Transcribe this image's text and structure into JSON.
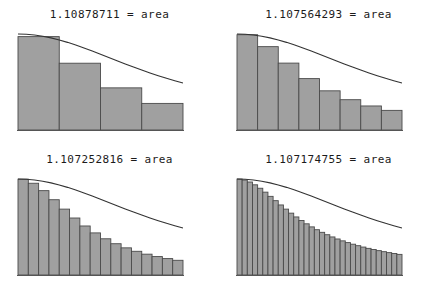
{
  "figure": {
    "title_suffix": "= area",
    "function_expression": "decreasing curve y = f(x)",
    "colors": {
      "bar_fill": "#a0a0a0",
      "bar_stroke": "#4a4a4a",
      "curve": "#333333",
      "axis": "#555555",
      "background": "#ffffff",
      "text": "#1b1b1b"
    }
  },
  "panels": [
    {
      "id": "panel-4",
      "position": "top-left",
      "title": "1.10878711 = area",
      "area_value": "1.10878711",
      "rectangle_count": 4
    },
    {
      "id": "panel-8",
      "position": "top-right",
      "title": "1.107564293 = area",
      "area_value": "1.107564293",
      "rectangle_count": 8
    },
    {
      "id": "panel-16",
      "position": "bottom-left",
      "title": "1.107252816 = area",
      "area_value": "1.107252816",
      "rectangle_count": 16
    },
    {
      "id": "panel-32",
      "position": "bottom-right",
      "title": "1.107174755 = area",
      "area_value": "1.107174755",
      "rectangle_count": 32
    }
  ],
  "chart_data": [
    {
      "type": "bar",
      "title": "1.10878711 = area",
      "subtitle": "",
      "xlabel": "",
      "ylabel": "",
      "legend": [],
      "grid": false,
      "n_rectangles": 4,
      "rule": "midpoint",
      "xlim": [
        0,
        1
      ],
      "ylim": [
        0,
        1
      ],
      "curve_label": "f(x)",
      "categories": [
        "0.125",
        "0.375",
        "0.625",
        "0.875"
      ],
      "bar_left_edges": [
        0.0,
        0.25,
        0.5,
        0.75
      ],
      "bar_width_fraction": 0.25,
      "values": [
        0.9727,
        0.6957,
        0.439,
        0.2771
      ],
      "curve_x": [
        0.0,
        0.05,
        0.1,
        0.15,
        0.2,
        0.25,
        0.3,
        0.35,
        0.4,
        0.45,
        0.5,
        0.55,
        0.6,
        0.65,
        0.7,
        0.75,
        0.8,
        0.85,
        0.9,
        0.95,
        1.0
      ],
      "curve_y": [
        1.0,
        0.9974,
        0.9896,
        0.9769,
        0.9596,
        0.9381,
        0.913,
        0.8849,
        0.8544,
        0.8222,
        0.789,
        0.7552,
        0.7215,
        0.6882,
        0.6557,
        0.6243,
        0.5941,
        0.5654,
        0.5383,
        0.5127,
        0.4887
      ]
    },
    {
      "type": "bar",
      "title": "1.107564293 = area",
      "subtitle": "",
      "xlabel": "",
      "ylabel": "",
      "legend": [],
      "grid": false,
      "n_rectangles": 8,
      "rule": "midpoint",
      "xlim": [
        0,
        1
      ],
      "ylim": [
        0,
        1
      ],
      "curve_label": "f(x)",
      "categories": [
        "0.0625",
        "0.1875",
        "0.3125",
        "0.4375",
        "0.5625",
        "0.6875",
        "0.8125",
        "0.9375"
      ],
      "bar_left_edges": [
        0.0,
        0.125,
        0.25,
        0.375,
        0.5,
        0.625,
        0.75,
        0.875
      ],
      "bar_width_fraction": 0.125,
      "values": [
        0.9925,
        0.8682,
        0.6969,
        0.5354,
        0.4081,
        0.3156,
        0.2503,
        0.2045
      ],
      "curve_x": [
        0.0,
        0.05,
        0.1,
        0.15,
        0.2,
        0.25,
        0.3,
        0.35,
        0.4,
        0.45,
        0.5,
        0.55,
        0.6,
        0.65,
        0.7,
        0.75,
        0.8,
        0.85,
        0.9,
        0.95,
        1.0
      ],
      "curve_y": [
        1.0,
        0.9974,
        0.9896,
        0.9769,
        0.9596,
        0.9381,
        0.913,
        0.8849,
        0.8544,
        0.8222,
        0.789,
        0.7552,
        0.7215,
        0.6882,
        0.6557,
        0.6243,
        0.5941,
        0.5654,
        0.5383,
        0.5127,
        0.4887
      ]
    },
    {
      "type": "bar",
      "title": "1.107252816 = area",
      "subtitle": "",
      "xlabel": "",
      "ylabel": "",
      "legend": [],
      "grid": false,
      "n_rectangles": 16,
      "rule": "midpoint",
      "xlim": [
        0,
        1
      ],
      "ylim": [
        0,
        1
      ],
      "curve_label": "f(x)",
      "categories": [
        "0.03125",
        "0.09375",
        "0.15625",
        "0.21875",
        "0.28125",
        "0.34375",
        "0.40625",
        "0.46875",
        "0.53125",
        "0.59375",
        "0.65625",
        "0.71875",
        "0.78125",
        "0.84375",
        "0.90625",
        "0.96875"
      ],
      "bar_left_edges": [
        0.0,
        0.0625,
        0.125,
        0.1875,
        0.25,
        0.3125,
        0.375,
        0.4375,
        0.5,
        0.5625,
        0.625,
        0.6875,
        0.75,
        0.8125,
        0.875,
        0.9375
      ],
      "bar_width_fraction": 0.0625,
      "values": [
        0.9981,
        0.9557,
        0.8786,
        0.7842,
        0.6862,
        0.5936,
        0.5106,
        0.4385,
        0.3773,
        0.3258,
        0.2828,
        0.247,
        0.217,
        0.1919,
        0.1709,
        0.1531
      ],
      "curve_x": [
        0.0,
        0.05,
        0.1,
        0.15,
        0.2,
        0.25,
        0.3,
        0.35,
        0.4,
        0.45,
        0.5,
        0.55,
        0.6,
        0.65,
        0.7,
        0.75,
        0.8,
        0.85,
        0.9,
        0.95,
        1.0
      ],
      "curve_y": [
        1.0,
        0.9974,
        0.9896,
        0.9769,
        0.9596,
        0.9381,
        0.913,
        0.8849,
        0.8544,
        0.8222,
        0.789,
        0.7552,
        0.7215,
        0.6882,
        0.6557,
        0.6243,
        0.5941,
        0.5654,
        0.5383,
        0.5127,
        0.4887
      ]
    },
    {
      "type": "bar",
      "title": "1.107174755 = area",
      "subtitle": "",
      "xlabel": "",
      "ylabel": "",
      "legend": [],
      "grid": false,
      "n_rectangles": 32,
      "rule": "midpoint",
      "xlim": [
        0,
        1
      ],
      "ylim": [
        0,
        1
      ],
      "curve_label": "f(x)",
      "bar_width_fraction": 0.03125,
      "values": [
        0.9995,
        0.9891,
        0.9686,
        0.9395,
        0.9036,
        0.8629,
        0.8193,
        0.7744,
        0.7297,
        0.6861,
        0.6443,
        0.6048,
        0.5677,
        0.5332,
        0.5013,
        0.4718,
        0.4446,
        0.4196,
        0.3965,
        0.3752,
        0.3556,
        0.3375,
        0.3208,
        0.3053,
        0.2909,
        0.2776,
        0.2652,
        0.2537,
        0.243,
        0.233,
        0.2236,
        0.2148
      ],
      "curve_x": [
        0.0,
        0.05,
        0.1,
        0.15,
        0.2,
        0.25,
        0.3,
        0.35,
        0.4,
        0.45,
        0.5,
        0.55,
        0.6,
        0.65,
        0.7,
        0.75,
        0.8,
        0.85,
        0.9,
        0.95,
        1.0
      ],
      "curve_y": [
        1.0,
        0.9974,
        0.9896,
        0.9769,
        0.9596,
        0.9381,
        0.913,
        0.8849,
        0.8544,
        0.8222,
        0.789,
        0.7552,
        0.7215,
        0.6882,
        0.6557,
        0.6243,
        0.5941,
        0.5654,
        0.5383,
        0.5127,
        0.4887
      ]
    }
  ]
}
